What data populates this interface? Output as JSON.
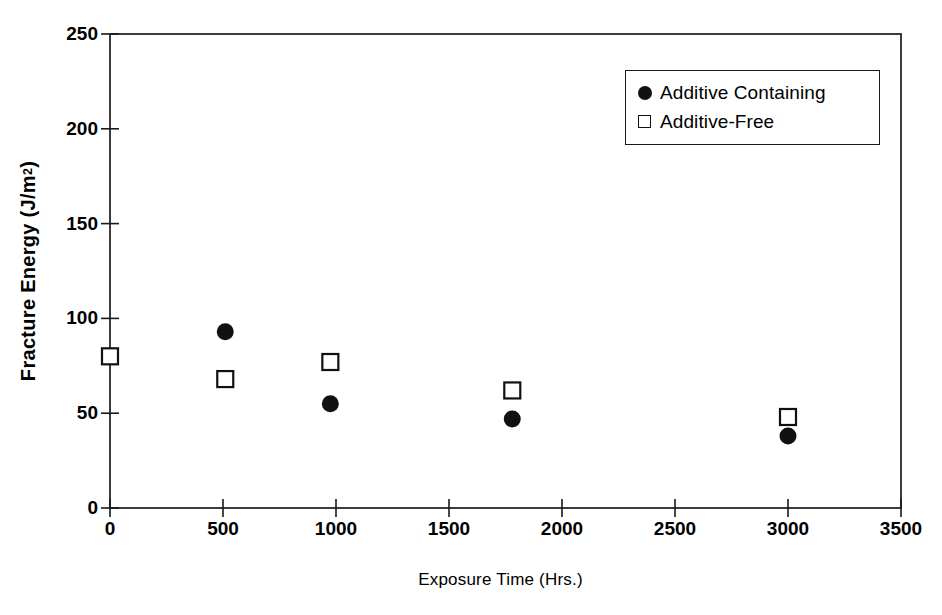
{
  "chart_data": {
    "type": "scatter",
    "title": "",
    "xlabel": "Exposure Time (Hrs.)",
    "ylabel": "Fracture Energy (J/m2)",
    "ylabel_text": "Fracture Energy (J/m",
    "ylabel_sup": "2",
    "ylabel_tail": ")",
    "xlim": [
      0,
      3500
    ],
    "ylim": [
      0,
      250
    ],
    "xticks": [
      0,
      500,
      1000,
      1500,
      2000,
      2500,
      3000,
      3500
    ],
    "xtick_labels": [
      "0",
      "500",
      "1000",
      "1500",
      "2000",
      "2500",
      "3000",
      "3500"
    ],
    "yticks": [
      0,
      50,
      100,
      150,
      200,
      250
    ],
    "ytick_labels": [
      "0",
      "50",
      "100",
      "150",
      "200",
      "250"
    ],
    "grid": false,
    "legend_position": "top-right",
    "series": [
      {
        "name": "Additive Containing",
        "marker": "filled-circle",
        "color": "#111111",
        "points": [
          {
            "x": 510,
            "y": 93
          },
          {
            "x": 975,
            "y": 55
          },
          {
            "x": 1780,
            "y": 47
          },
          {
            "x": 3000,
            "y": 38
          }
        ]
      },
      {
        "name": "Additive-Free",
        "marker": "open-square",
        "color": "#111111",
        "points": [
          {
            "x": 0,
            "y": 80
          },
          {
            "x": 510,
            "y": 68
          },
          {
            "x": 975,
            "y": 77
          },
          {
            "x": 1780,
            "y": 62
          },
          {
            "x": 3000,
            "y": 48
          }
        ]
      }
    ]
  },
  "legend": {
    "items": [
      {
        "label": "Additive Containing",
        "marker": "filled-circle"
      },
      {
        "label": "Additive-Free",
        "marker": "open-square"
      }
    ]
  }
}
